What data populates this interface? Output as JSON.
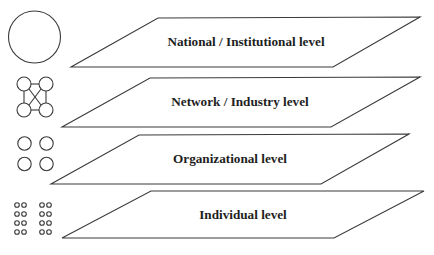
{
  "diagram": {
    "colors": {
      "background": "#ffffff",
      "stroke": "#3a3a3a",
      "text": "#1e1e1e"
    },
    "levels": [
      {
        "label": "National / Institutional level",
        "icon": "single-large-circle-icon",
        "panel_points": "158,18 420,17 333,67 71,67",
        "label_x": 246,
        "label_y": 46
      },
      {
        "label": "Network / Industry level",
        "icon": "connected-circles-network-icon",
        "panel_points": "150,78 420,77 331,127 62,127",
        "label_x": 240,
        "label_y": 106
      },
      {
        "label": "Organizational level",
        "icon": "four-circles-icon",
        "panel_points": "139,135 409,134 321,184 51,184",
        "label_x": 230,
        "label_y": 163
      },
      {
        "label": "Individual level",
        "icon": "many-small-circles-icon",
        "panel_points": "151,191 424,191 334,238 62,238",
        "label_x": 243,
        "label_y": 219
      }
    ]
  }
}
